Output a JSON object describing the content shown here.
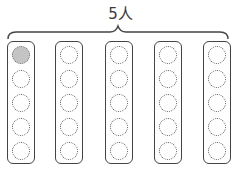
{
  "diagram": {
    "label": "5人",
    "brace": {
      "x_start": 7,
      "x_end": 229,
      "y_line": 32,
      "peak_x": 118
    },
    "columns": [
      {
        "left": 7,
        "slots": [
          true,
          false,
          false,
          false,
          false
        ]
      },
      {
        "left": 55,
        "slots": [
          false,
          false,
          false,
          false,
          false
        ]
      },
      {
        "left": 105,
        "slots": [
          false,
          false,
          false,
          false,
          false
        ]
      },
      {
        "left": 154,
        "slots": [
          false,
          false,
          false,
          false,
          false
        ]
      },
      {
        "left": 203,
        "slots": [
          false,
          false,
          false,
          false,
          false
        ]
      }
    ],
    "colors": {
      "stroke": "#444444",
      "filled": "#c4c4c4"
    }
  }
}
